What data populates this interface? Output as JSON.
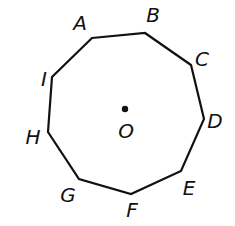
{
  "figure": {
    "shape": "nonagon",
    "center": {
      "label": "O"
    },
    "vertices": [
      {
        "label": "A"
      },
      {
        "label": "B"
      },
      {
        "label": "C"
      },
      {
        "label": "D"
      },
      {
        "label": "E"
      },
      {
        "label": "F"
      },
      {
        "label": "G"
      },
      {
        "label": "H"
      },
      {
        "label": "I"
      }
    ]
  }
}
